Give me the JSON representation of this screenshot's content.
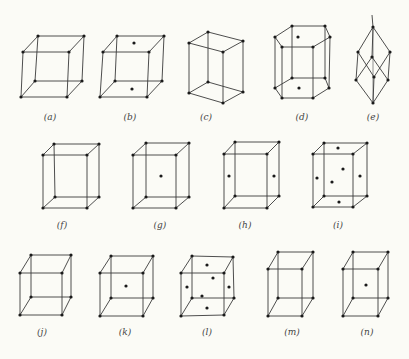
{
  "figure": {
    "colors": {
      "background": "#fbfbf6",
      "line": "#3a3a3a",
      "point": "#1a1a1a"
    },
    "panels": [
      {
        "id": "a",
        "label": "(a)",
        "label_pos": [
          50,
          120
        ],
        "corners": [
          [
            38,
            36
          ],
          [
            84,
            36
          ],
          [
            69,
            52
          ],
          [
            23,
            52
          ],
          [
            35,
            81
          ],
          [
            82,
            81
          ],
          [
            67,
            97
          ],
          [
            21,
            97
          ]
        ],
        "extra_points": []
      },
      {
        "id": "b",
        "label": "(b)",
        "label_pos": [
          130,
          120
        ],
        "corners": [
          [
            117,
            36
          ],
          [
            164,
            36
          ],
          [
            149,
            52
          ],
          [
            103,
            52
          ],
          [
            115,
            81
          ],
          [
            162,
            81
          ],
          [
            147,
            97
          ],
          [
            100,
            97
          ]
        ],
        "extra_points": [
          [
            134,
            43
          ],
          [
            132,
            89
          ]
        ]
      },
      {
        "id": "c",
        "label": "(c)",
        "label_pos": [
          206,
          120
        ],
        "corners": [
          [
            208,
            32
          ],
          [
            243,
            41
          ],
          [
            223,
            52
          ],
          [
            189,
            43
          ],
          [
            208,
            82
          ],
          [
            243,
            92
          ],
          [
            223,
            103
          ],
          [
            189,
            93
          ]
        ],
        "extra_points": []
      },
      {
        "id": "d",
        "label": "(d)",
        "label_pos": [
          302,
          120
        ],
        "shape": "hexagonal",
        "top_hex": [
          [
            292,
            26
          ],
          [
            325,
            26
          ],
          [
            330,
            37
          ],
          [
            313,
            47
          ],
          [
            282,
            47
          ],
          [
            275,
            37
          ]
        ],
        "top_center": [
          298,
          37
        ],
        "bottom_hex": [
          [
            292,
            78
          ],
          [
            325,
            78
          ],
          [
            329,
            88
          ],
          [
            313,
            98
          ],
          [
            282,
            98
          ],
          [
            275,
            88
          ]
        ],
        "bottom_center": [
          299,
          88
        ]
      },
      {
        "id": "e",
        "label": "(e)",
        "label_pos": [
          373,
          120
        ],
        "shape": "rhombohedral",
        "axis_top": [
          372,
          15
        ],
        "top": [
          373,
          27
        ],
        "upper": [
          [
            358,
            52
          ],
          [
            390,
            52
          ],
          [
            372,
            57
          ]
        ],
        "lower": [
          [
            356,
            80
          ],
          [
            388,
            80
          ],
          [
            374,
            77
          ]
        ],
        "bottom": [
          373,
          103
        ]
      },
      {
        "id": "f",
        "label": "(f)",
        "label_pos": [
          62,
          228
        ],
        "corners": [
          [
            54,
            144
          ],
          [
            99,
            144
          ],
          [
            87,
            155
          ],
          [
            43,
            155
          ],
          [
            55,
            197
          ],
          [
            99,
            197
          ],
          [
            87,
            208
          ],
          [
            43,
            208
          ]
        ],
        "extra_points": []
      },
      {
        "id": "g",
        "label": "(g)",
        "label_pos": [
          160,
          228
        ],
        "corners": [
          [
            146,
            143
          ],
          [
            189,
            143
          ],
          [
            176,
            155
          ],
          [
            133,
            155
          ],
          [
            146,
            197
          ],
          [
            189,
            197
          ],
          [
            176,
            208
          ],
          [
            133,
            208
          ]
        ],
        "extra_points": [
          [
            161,
            176
          ]
        ]
      },
      {
        "id": "h",
        "label": "(h)",
        "label_pos": [
          245,
          228
        ],
        "corners": [
          [
            235,
            142
          ],
          [
            279,
            142
          ],
          [
            267,
            154
          ],
          [
            224,
            154
          ],
          [
            235,
            196
          ],
          [
            279,
            196
          ],
          [
            267,
            208
          ],
          [
            224,
            208
          ]
        ],
        "extra_points": [
          [
            229,
            176
          ],
          [
            274,
            176
          ]
        ]
      },
      {
        "id": "i",
        "label": "(i)",
        "label_pos": [
          338,
          228
        ],
        "corners": [
          [
            324,
            143
          ],
          [
            367,
            143
          ],
          [
            353,
            154
          ],
          [
            313,
            154
          ],
          [
            324,
            196
          ],
          [
            367,
            196
          ],
          [
            353,
            207
          ],
          [
            313,
            207
          ]
        ],
        "extra_points": [
          [
            338,
            148
          ],
          [
            343,
            169
          ],
          [
            317,
            178
          ],
          [
            360,
            176
          ],
          [
            332,
            182
          ],
          [
            339,
            202
          ]
        ]
      },
      {
        "id": "j",
        "label": "(j)",
        "label_pos": [
          42,
          335
        ],
        "corners": [
          [
            31,
            255
          ],
          [
            71,
            255
          ],
          [
            62,
            273
          ],
          [
            20,
            273
          ],
          [
            31,
            297
          ],
          [
            71,
            297
          ],
          [
            62,
            315
          ],
          [
            20,
            315
          ]
        ],
        "extra_points": []
      },
      {
        "id": "k",
        "label": "(k)",
        "label_pos": [
          125,
          335
        ],
        "corners": [
          [
            111,
            256
          ],
          [
            153,
            256
          ],
          [
            143,
            273
          ],
          [
            100,
            273
          ],
          [
            111,
            298
          ],
          [
            153,
            298
          ],
          [
            143,
            316
          ],
          [
            100,
            316
          ]
        ],
        "extra_points": [
          [
            126,
            286
          ]
        ]
      },
      {
        "id": "l",
        "label": "(l)",
        "label_pos": [
          207,
          335
        ],
        "corners": [
          [
            192,
            256
          ],
          [
            233,
            257
          ],
          [
            224,
            273
          ],
          [
            181,
            273
          ],
          [
            192,
            298
          ],
          [
            234,
            298
          ],
          [
            224,
            315
          ],
          [
            181,
            316
          ]
        ],
        "extra_points": [
          [
            207,
            265
          ],
          [
            213,
            278
          ],
          [
            187,
            287
          ],
          [
            229,
            287
          ],
          [
            202,
            296
          ],
          [
            207,
            308
          ]
        ]
      },
      {
        "id": "m",
        "label": "(m)",
        "label_pos": [
          292,
          335
        ],
        "corners": [
          [
            278,
            252
          ],
          [
            313,
            252
          ],
          [
            302,
            269
          ],
          [
            268,
            269
          ],
          [
            278,
            298
          ],
          [
            313,
            298
          ],
          [
            302,
            316
          ],
          [
            268,
            316
          ]
        ],
        "extra_points": []
      },
      {
        "id": "n",
        "label": "(n)",
        "label_pos": [
          367,
          335
        ],
        "corners": [
          [
            353,
            252
          ],
          [
            388,
            252
          ],
          [
            378,
            269
          ],
          [
            343,
            269
          ],
          [
            353,
            298
          ],
          [
            388,
            298
          ],
          [
            378,
            316
          ],
          [
            343,
            316
          ]
        ],
        "extra_points": [
          [
            366,
            285
          ]
        ]
      }
    ]
  }
}
